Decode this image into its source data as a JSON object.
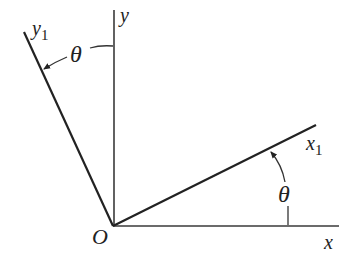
{
  "diagram": {
    "type": "coordinate-rotation",
    "labels": {
      "origin": "O",
      "x_axis": "x",
      "y_axis": "y",
      "x1_axis_base": "x",
      "x1_axis_sub": "1",
      "y1_axis_base": "y",
      "y1_axis_sub": "1",
      "angle_x": "θ",
      "angle_y": "θ"
    },
    "colors": {
      "background": "#ffffff",
      "lines": "#222222",
      "axes": "#3a3a3a"
    }
  }
}
